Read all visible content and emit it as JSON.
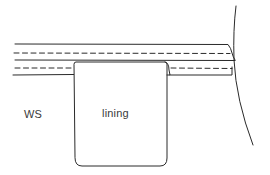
{
  "diagram": {
    "type": "sewing-illustration",
    "labels": {
      "wrong_side": "WS",
      "lining": "lining"
    },
    "colors": {
      "stroke": "#2a2a2a",
      "background": "#ffffff",
      "text": "#3a3a3a"
    },
    "elements": [
      {
        "name": "waistband-top-edge",
        "style": "solid"
      },
      {
        "name": "stitching-line-upper",
        "style": "dashed"
      },
      {
        "name": "waistband-fold-line",
        "style": "solid"
      },
      {
        "name": "stitching-line-lower",
        "style": "dashed"
      },
      {
        "name": "waistband-bottom-edge",
        "style": "solid"
      },
      {
        "name": "lining-panel",
        "style": "solid",
        "shape": "rounded-bottom-rectangle"
      },
      {
        "name": "garment-side-curve",
        "style": "solid"
      }
    ]
  }
}
